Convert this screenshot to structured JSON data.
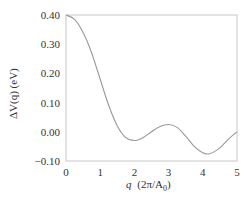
{
  "chart_data": {
    "type": "line",
    "title": "",
    "xlabel": "q (2π/A0)",
    "ylabel": "ΔV(q) (eV)",
    "xlim": [
      0,
      5
    ],
    "ylim": [
      -0.1,
      0.4
    ],
    "x_ticks": [
      "0",
      "1",
      "2",
      "3",
      "4",
      "5"
    ],
    "y_ticks": [
      "0.40",
      "0.30",
      "0.20",
      "0.10",
      "0.00",
      "−0.10"
    ],
    "grid": false,
    "legend": null,
    "series": [
      {
        "name": "ΔV(q)",
        "color": "#999999",
        "x": [
          0,
          0.25,
          0.5,
          0.75,
          1.0,
          1.25,
          1.5,
          1.75,
          2.0,
          2.25,
          2.5,
          2.75,
          3.0,
          3.25,
          3.5,
          3.75,
          4.0,
          4.2,
          4.5,
          4.75,
          5.0
        ],
        "y": [
          0.4,
          0.385,
          0.34,
          0.27,
          0.18,
          0.09,
          0.02,
          -0.02,
          -0.03,
          -0.02,
          0.0,
          0.018,
          0.025,
          0.015,
          -0.015,
          -0.05,
          -0.072,
          -0.075,
          -0.055,
          -0.025,
          0.0
        ]
      }
    ]
  },
  "axes": {
    "xlabel_q": "q",
    "xlabel_units": "(2π/A",
    "xlabel_sub": "0",
    "xlabel_close": ")",
    "ylabel": "ΔV(q) (eV)"
  }
}
